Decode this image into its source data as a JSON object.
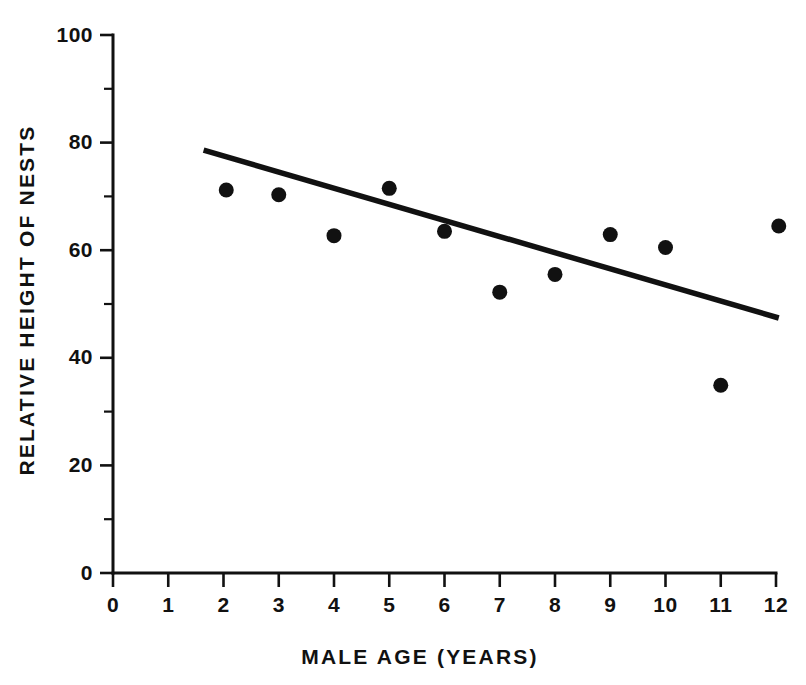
{
  "chart_data": {
    "type": "scatter",
    "title": "",
    "subtitle": "",
    "xlabel": "MALE AGE  (YEARS)",
    "ylabel": "RELATIVE HEIGHT OF NESTS",
    "xlim": [
      0,
      12
    ],
    "ylim": [
      0,
      100
    ],
    "grid": false,
    "legend": false,
    "legend_position": "none",
    "x_ticks_major": [
      0,
      1,
      2,
      3,
      4,
      5,
      6,
      7,
      8,
      9,
      10,
      11,
      12
    ],
    "x_tick_labels": [
      "0",
      "1",
      "2",
      "3",
      "4",
      "5",
      "6",
      "7",
      "8",
      "9",
      "10",
      "11",
      "12"
    ],
    "x_ticks_minor": [],
    "y_ticks_major": [
      0,
      20,
      40,
      60,
      80,
      100
    ],
    "y_tick_labels": [
      "0",
      "20",
      "40",
      "60",
      "80",
      "100"
    ],
    "y_ticks_minor": [
      10,
      30,
      50,
      70,
      90
    ],
    "marker": "filled-circle",
    "marker_color": "#111111",
    "series": [
      {
        "name": "Nest height observations",
        "type": "scatter",
        "x": [
          2.05,
          3.0,
          4.0,
          5.0,
          6.0,
          7.0,
          8.0,
          9.0,
          10.0,
          11.0,
          12.05
        ],
        "y": [
          71.2,
          70.3,
          62.7,
          71.5,
          63.5,
          52.2,
          55.5,
          62.9,
          60.5,
          34.9,
          64.5
        ]
      },
      {
        "name": "Regression line",
        "type": "line",
        "x": [
          1.64,
          12.05
        ],
        "y": [
          78.6,
          47.4
        ],
        "color": "#111111"
      }
    ],
    "annotations": []
  },
  "figure": {
    "background_color": "#ffffff",
    "foreground_color": "#111111"
  }
}
